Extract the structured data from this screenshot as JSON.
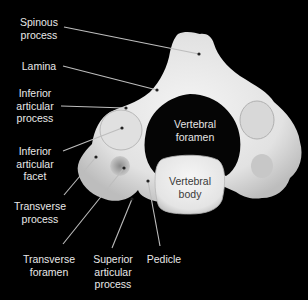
{
  "figure": {
    "background_color": "#000000",
    "bone_color": "#e9e9e9",
    "label_color": "#e8e8e8",
    "leader_line_color": "#bdbdbd"
  },
  "labels": {
    "spinous_process": "Spinous\nprocess",
    "lamina": "Lamina",
    "inferior_articular_process": "Inferior\narticular\nprocess",
    "inferior_articular_facet": "Inferior\narticular\nfacet",
    "transverse_process": "Transverse\nprocess",
    "transverse_foramen": "Transverse\nforamen",
    "superior_articular_process": "Superior\narticular\nprocess",
    "pedicle": "Pedicle",
    "vertebral_foramen": "Vertebral\nforamen",
    "vertebral_body": "Vertebral\nbody"
  }
}
